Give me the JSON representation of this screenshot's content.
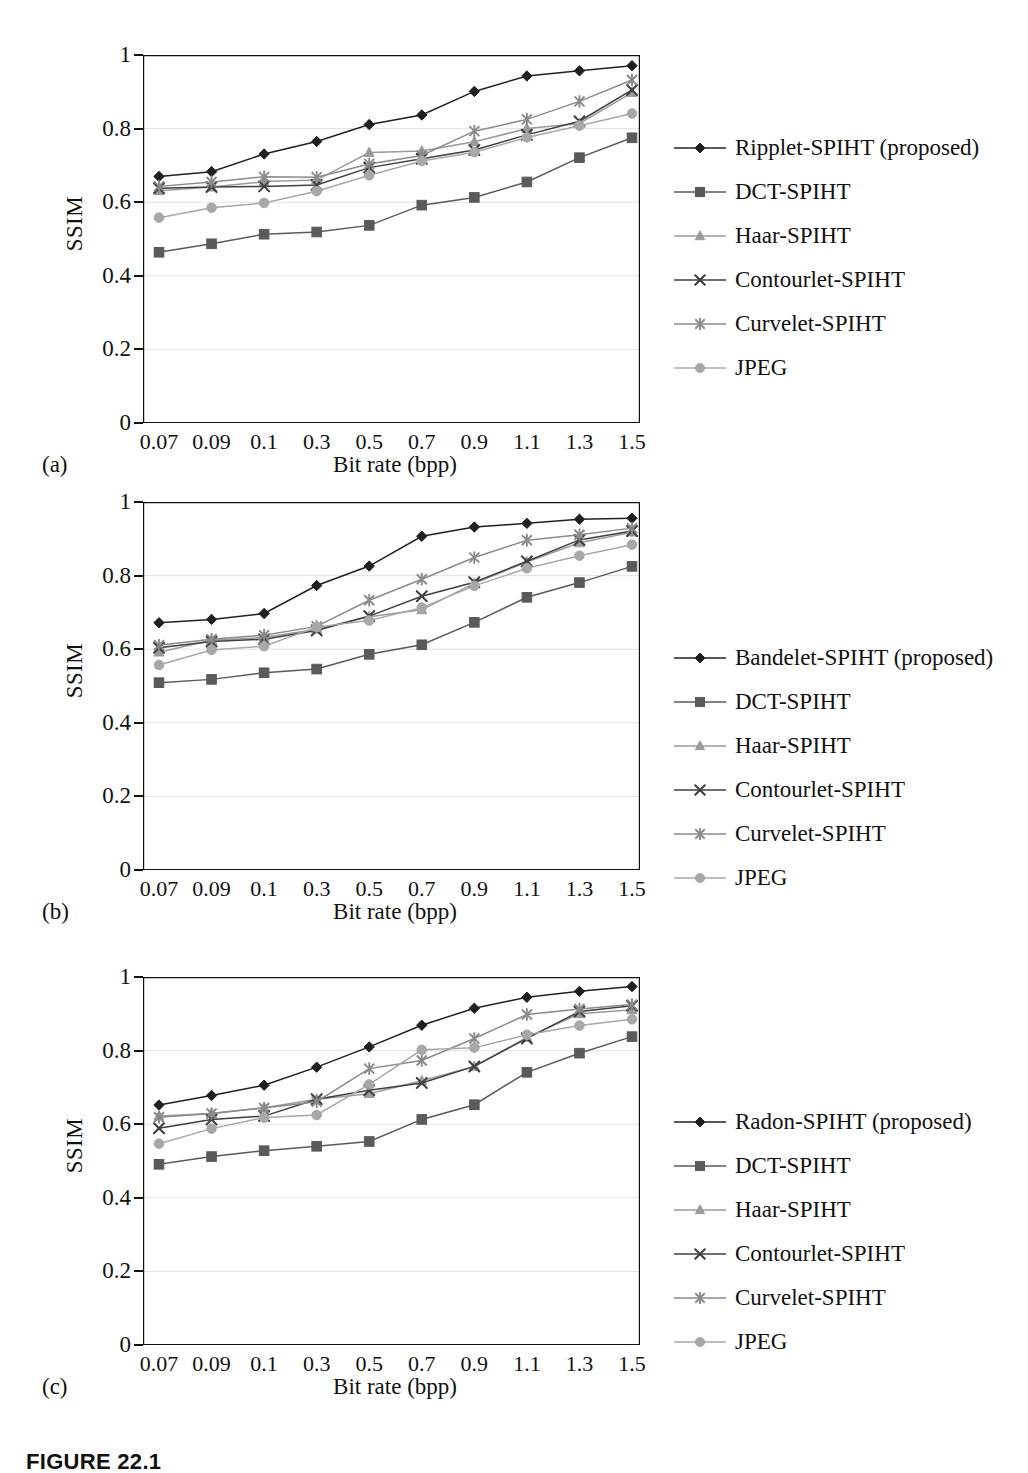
{
  "figure": {
    "caption": "FIGURE 22.1",
    "subfigure_labels": [
      "(a)",
      "(b)",
      "(c)"
    ]
  },
  "axes": {
    "ylabel": "SSIM",
    "xlabel": "Bit rate (bpp)",
    "yticks": [
      "0",
      "0.2",
      "0.4",
      "0.6",
      "0.8",
      "1"
    ],
    "ytick_values": [
      0,
      0.2,
      0.4,
      0.6,
      0.8,
      1
    ],
    "xticks": [
      "0.07",
      "0.09",
      "0.1",
      "0.3",
      "0.5",
      "0.7",
      "0.9",
      "1.1",
      "1.3",
      "1.5"
    ]
  },
  "colors": {
    "proposed": "#231f20",
    "dct": "#5a5a5a",
    "haar": "#9b9b9b",
    "contourlet": "#3f3f3f",
    "curvelet": "#8a8a8a",
    "jpeg": "#a8a8a8",
    "axis": "#111111",
    "grid": "#e3e3e3",
    "frame": "#111111"
  },
  "markers": {
    "proposed": "diamond",
    "dct": "square",
    "haar": "triangle",
    "contourlet": "x",
    "curvelet": "star",
    "jpeg": "circle"
  },
  "chart_data": [
    {
      "type": "line",
      "id": "a",
      "title": "",
      "xlabel": "Bit rate (bpp)",
      "ylabel": "SSIM",
      "categories": [
        "0.07",
        "0.09",
        "0.1",
        "0.3",
        "0.5",
        "0.7",
        "0.9",
        "1.1",
        "1.3",
        "1.5"
      ],
      "ylim": [
        0,
        1
      ],
      "grid": true,
      "legend_position": "right",
      "series": [
        {
          "name": "Ripplet-SPIHT (proposed)",
          "marker": "diamond",
          "color": "#231f20",
          "values": [
            0.67,
            0.683,
            0.731,
            0.765,
            0.811,
            0.837,
            0.901,
            0.943,
            0.957,
            0.971
          ]
        },
        {
          "name": "DCT-SPIHT",
          "marker": "square",
          "color": "#5a5a5a",
          "values": [
            0.464,
            0.487,
            0.513,
            0.519,
            0.537,
            0.592,
            0.613,
            0.655,
            0.721,
            0.775
          ]
        },
        {
          "name": "Haar-SPIHT",
          "marker": "triangle",
          "color": "#9b9b9b",
          "values": [
            0.631,
            0.641,
            0.656,
            0.66,
            0.735,
            0.739,
            0.764,
            0.8,
            0.814,
            0.898
          ]
        },
        {
          "name": "Contourlet-SPIHT",
          "marker": "x",
          "color": "#3f3f3f",
          "values": [
            0.638,
            0.641,
            0.643,
            0.647,
            0.694,
            0.718,
            0.742,
            0.783,
            0.82,
            0.905
          ]
        },
        {
          "name": "Curvelet-SPIHT",
          "marker": "star",
          "color": "#8a8a8a",
          "values": [
            0.643,
            0.655,
            0.669,
            0.668,
            0.704,
            0.727,
            0.793,
            0.825,
            0.874,
            0.932
          ]
        },
        {
          "name": "JPEG",
          "marker": "circle",
          "color": "#a8a8a8",
          "values": [
            0.558,
            0.585,
            0.598,
            0.63,
            0.673,
            0.712,
            0.736,
            0.776,
            0.808,
            0.841
          ]
        }
      ]
    },
    {
      "type": "line",
      "id": "b",
      "title": "",
      "xlabel": "Bit rate (bpp)",
      "ylabel": "SSIM",
      "categories": [
        "0.07",
        "0.09",
        "0.1",
        "0.3",
        "0.5",
        "0.7",
        "0.9",
        "1.1",
        "1.3",
        "1.5"
      ],
      "ylim": [
        0,
        1
      ],
      "grid": true,
      "legend_position": "right",
      "series": [
        {
          "name": "Bandelet-SPIHT (proposed)",
          "marker": "diamond",
          "color": "#231f20",
          "values": [
            0.672,
            0.681,
            0.697,
            0.773,
            0.826,
            0.907,
            0.932,
            0.942,
            0.953,
            0.956
          ]
        },
        {
          "name": "DCT-SPIHT",
          "marker": "square",
          "color": "#5a5a5a",
          "values": [
            0.509,
            0.518,
            0.536,
            0.546,
            0.586,
            0.612,
            0.673,
            0.741,
            0.781,
            0.825
          ]
        },
        {
          "name": "Haar-SPIHT",
          "marker": "triangle",
          "color": "#9b9b9b",
          "values": [
            0.592,
            0.624,
            0.632,
            0.654,
            0.688,
            0.707,
            0.779,
            0.837,
            0.889,
            0.918
          ]
        },
        {
          "name": "Contourlet-SPIHT",
          "marker": "x",
          "color": "#3f3f3f",
          "values": [
            0.604,
            0.621,
            0.627,
            0.651,
            0.69,
            0.744,
            0.782,
            0.839,
            0.897,
            0.921
          ]
        },
        {
          "name": "Curvelet-SPIHT",
          "marker": "star",
          "color": "#8a8a8a",
          "values": [
            0.611,
            0.627,
            0.638,
            0.662,
            0.733,
            0.79,
            0.849,
            0.896,
            0.911,
            0.929
          ]
        },
        {
          "name": "JPEG",
          "marker": "circle",
          "color": "#a8a8a8",
          "values": [
            0.557,
            0.598,
            0.608,
            0.66,
            0.678,
            0.713,
            0.772,
            0.82,
            0.854,
            0.884
          ]
        }
      ]
    },
    {
      "type": "line",
      "id": "c",
      "title": "",
      "xlabel": "Bit rate (bpp)",
      "ylabel": "SSIM",
      "categories": [
        "0.07",
        "0.09",
        "0.1",
        "0.3",
        "0.5",
        "0.7",
        "0.9",
        "1.1",
        "1.3",
        "1.5"
      ],
      "ylim": [
        0,
        1
      ],
      "grid": true,
      "legend_position": "right",
      "series": [
        {
          "name": "Radon-SPIHT (proposed)",
          "marker": "diamond",
          "color": "#231f20",
          "values": [
            0.652,
            0.678,
            0.706,
            0.755,
            0.81,
            0.869,
            0.915,
            0.945,
            0.961,
            0.974
          ]
        },
        {
          "name": "DCT-SPIHT",
          "marker": "square",
          "color": "#5a5a5a",
          "values": [
            0.491,
            0.512,
            0.528,
            0.54,
            0.553,
            0.613,
            0.653,
            0.741,
            0.793,
            0.838
          ]
        },
        {
          "name": "Haar-SPIHT",
          "marker": "triangle",
          "color": "#9b9b9b",
          "values": [
            0.622,
            0.629,
            0.645,
            0.668,
            0.683,
            0.718,
            0.757,
            0.836,
            0.9,
            0.911
          ]
        },
        {
          "name": "Contourlet-SPIHT",
          "marker": "x",
          "color": "#3f3f3f",
          "values": [
            0.589,
            0.613,
            0.622,
            0.668,
            0.692,
            0.712,
            0.757,
            0.833,
            0.906,
            0.922
          ]
        },
        {
          "name": "Curvelet-SPIHT",
          "marker": "star",
          "color": "#8a8a8a",
          "values": [
            0.619,
            0.629,
            0.644,
            0.661,
            0.751,
            0.773,
            0.833,
            0.898,
            0.913,
            0.925
          ]
        },
        {
          "name": "JPEG",
          "marker": "circle",
          "color": "#a8a8a8",
          "values": [
            0.547,
            0.588,
            0.618,
            0.625,
            0.708,
            0.802,
            0.808,
            0.843,
            0.868,
            0.885
          ]
        }
      ]
    }
  ],
  "legends": [
    {
      "items": [
        {
          "label": "Ripplet-SPIHT (proposed)",
          "marker": "diamond",
          "color": "#231f20"
        },
        {
          "label": "DCT-SPIHT",
          "marker": "square",
          "color": "#5a5a5a"
        },
        {
          "label": "Haar-SPIHT",
          "marker": "triangle",
          "color": "#9b9b9b"
        },
        {
          "label": "Contourlet-SPIHT",
          "marker": "x",
          "color": "#3f3f3f"
        },
        {
          "label": "Curvelet-SPIHT",
          "marker": "star",
          "color": "#8a8a8a"
        },
        {
          "label": "JPEG",
          "marker": "circle",
          "color": "#a8a8a8"
        }
      ]
    },
    {
      "items": [
        {
          "label": "Bandelet-SPIHT (proposed)",
          "marker": "diamond",
          "color": "#231f20"
        },
        {
          "label": "DCT-SPIHT",
          "marker": "square",
          "color": "#5a5a5a"
        },
        {
          "label": "Haar-SPIHT",
          "marker": "triangle",
          "color": "#9b9b9b"
        },
        {
          "label": "Contourlet-SPIHT",
          "marker": "x",
          "color": "#3f3f3f"
        },
        {
          "label": "Curvelet-SPIHT",
          "marker": "star",
          "color": "#8a8a8a"
        },
        {
          "label": "JPEG",
          "marker": "circle",
          "color": "#a8a8a8"
        }
      ]
    },
    {
      "items": [
        {
          "label": "Radon-SPIHT (proposed)",
          "marker": "diamond",
          "color": "#231f20"
        },
        {
          "label": "DCT-SPIHT",
          "marker": "square",
          "color": "#5a5a5a"
        },
        {
          "label": "Haar-SPIHT",
          "marker": "triangle",
          "color": "#9b9b9b"
        },
        {
          "label": "Contourlet-SPIHT",
          "marker": "x",
          "color": "#3f3f3f"
        },
        {
          "label": "Curvelet-SPIHT",
          "marker": "star",
          "color": "#8a8a8a"
        },
        {
          "label": "JPEG",
          "marker": "circle",
          "color": "#a8a8a8"
        }
      ]
    }
  ]
}
